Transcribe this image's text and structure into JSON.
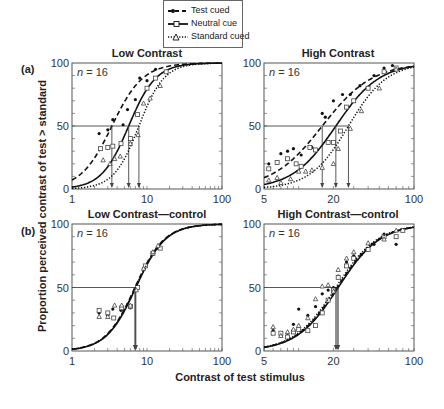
{
  "legend": {
    "items": [
      {
        "label": "Test cued",
        "style": "dashed",
        "marker": "filled-circle"
      },
      {
        "label": "Neutral cue",
        "style": "solid",
        "marker": "open-square"
      },
      {
        "label": "Standard cued",
        "style": "dotted",
        "marker": "open-triangle"
      }
    ]
  },
  "axis_labels": {
    "y": "Proportion perceived contrast of test > standard",
    "x": "Contrast of test stimulus"
  },
  "row_labels": {
    "a": "(a)",
    "b": "(b)"
  },
  "chart_data": [
    {
      "type": "line",
      "panel": "(a)",
      "title": "Low Contrast",
      "annotation": "n = 16",
      "xscale": "log",
      "xlim": [
        1,
        100
      ],
      "xticks": [
        "1",
        "10",
        "100"
      ],
      "ylim": [
        0,
        100
      ],
      "yticks": [
        "0",
        "50",
        "100"
      ],
      "reference_line_y": 50,
      "series": [
        {
          "name": "Test cued",
          "pse": 3.4,
          "slope": 2.1,
          "points": [
            [
              2.3,
              44
            ],
            [
              3,
              47
            ],
            [
              3.5,
              55
            ],
            [
              4.8,
              51
            ],
            [
              5.5,
              63
            ],
            [
              7,
              71
            ],
            [
              8,
              88
            ],
            [
              10,
              86
            ],
            [
              13,
              95
            ]
          ]
        },
        {
          "name": "Neutral cue",
          "pse": 5.7,
          "slope": 2.4,
          "points": [
            [
              2.4,
              32
            ],
            [
              3,
              33
            ],
            [
              3.5,
              34
            ],
            [
              4.5,
              36
            ],
            [
              6,
              40
            ],
            [
              7.5,
              59
            ],
            [
              10,
              80
            ],
            [
              13,
              88
            ],
            [
              18,
              93
            ]
          ]
        },
        {
          "name": "Standard cued",
          "pse": 7.8,
          "slope": 2.6,
          "points": [
            [
              2.6,
              23
            ],
            [
              3.2,
              20
            ],
            [
              3.7,
              24
            ],
            [
              4.4,
              26
            ],
            [
              6,
              36
            ],
            [
              7.6,
              43
            ],
            [
              9,
              68
            ],
            [
              11,
              72
            ],
            [
              15,
              82
            ]
          ]
        }
      ]
    },
    {
      "type": "line",
      "panel": "(a)",
      "title": "High Contrast",
      "annotation": "n = 16",
      "xscale": "log",
      "xlim": [
        5,
        100
      ],
      "xticks": [
        "5",
        "20",
        "100"
      ],
      "ylim": [
        0,
        100
      ],
      "yticks": [
        "0",
        "50",
        "100"
      ],
      "reference_line_y": 50,
      "series": [
        {
          "name": "Test cued",
          "pse": 16,
          "slope": 2.0,
          "points": [
            [
              5.5,
              20
            ],
            [
              7,
              28
            ],
            [
              8,
              30
            ],
            [
              9,
              32
            ],
            [
              10.5,
              27
            ],
            [
              13,
              33
            ],
            [
              16,
              60
            ],
            [
              17,
              57
            ],
            [
              20,
              70
            ],
            [
              24,
              75
            ],
            [
              28,
              75
            ],
            [
              34,
              82
            ],
            [
              45,
              90
            ],
            [
              55,
              96
            ],
            [
              65,
              98
            ]
          ]
        },
        {
          "name": "Neutral cue",
          "pse": 21,
          "slope": 2.3,
          "points": [
            [
              5.5,
              16
            ],
            [
              6.5,
              21
            ],
            [
              8,
              24
            ],
            [
              9.5,
              20
            ],
            [
              10.5,
              18
            ],
            [
              12.5,
              33
            ],
            [
              14,
              31
            ],
            [
              18,
              37
            ],
            [
              20,
              37
            ],
            [
              23,
              46
            ],
            [
              26,
              65
            ],
            [
              30,
              70
            ],
            [
              40,
              80
            ],
            [
              55,
              93
            ],
            [
              70,
              96
            ]
          ]
        },
        {
          "name": "Standard cued",
          "pse": 27,
          "slope": 2.6,
          "points": [
            [
              5.5,
              7
            ],
            [
              6.5,
              9
            ],
            [
              7,
              5
            ],
            [
              8.5,
              8
            ],
            [
              10,
              14
            ],
            [
              11.5,
              14
            ],
            [
              13,
              15
            ],
            [
              16,
              17
            ],
            [
              20,
              20
            ],
            [
              22,
              32
            ],
            [
              28,
              48
            ],
            [
              35,
              62
            ],
            [
              50,
              80
            ],
            [
              70,
              95
            ]
          ]
        }
      ]
    },
    {
      "type": "line",
      "panel": "(b)",
      "title": "Low Contrast—control",
      "annotation": "n = 16",
      "xscale": "log",
      "xlim": [
        1,
        100
      ],
      "xticks": [
        "1",
        "10",
        "100"
      ],
      "ylim": [
        0,
        100
      ],
      "yticks": [
        "0",
        "50",
        "100"
      ],
      "reference_line_y": 50,
      "series": [
        {
          "name": "Test cued",
          "pse": 6.9,
          "slope": 2.2,
          "points": [
            [
              2.3,
              30
            ],
            [
              3,
              28
            ],
            [
              3.5,
              33
            ],
            [
              4.5,
              32
            ],
            [
              6,
              34
            ],
            [
              7,
              48
            ],
            [
              9,
              65
            ],
            [
              12,
              76
            ],
            [
              14,
              81
            ]
          ]
        },
        {
          "name": "Neutral cue",
          "pse": 7.1,
          "slope": 2.2,
          "points": [
            [
              2.3,
              32
            ],
            [
              3,
              30
            ],
            [
              3.6,
              26
            ],
            [
              4.6,
              34
            ],
            [
              6,
              35
            ],
            [
              7.5,
              50
            ],
            [
              9.5,
              67
            ],
            [
              12,
              77
            ],
            [
              15,
              81
            ]
          ]
        },
        {
          "name": "Standard cued",
          "pse": 7.0,
          "slope": 2.2,
          "points": [
            [
              2.3,
              27
            ],
            [
              3,
              27
            ],
            [
              3.7,
              36
            ],
            [
              4.6,
              36
            ],
            [
              6,
              36
            ],
            [
              7.2,
              48
            ],
            [
              9,
              65
            ],
            [
              12,
              78
            ],
            [
              14,
              83
            ]
          ]
        }
      ]
    },
    {
      "type": "line",
      "panel": "(b)",
      "title": "High Contrast—control",
      "annotation": "n = 16",
      "xscale": "log",
      "xlim": [
        5,
        100
      ],
      "xticks": [
        "5",
        "20",
        "100"
      ],
      "ylim": [
        0,
        100
      ],
      "yticks": [
        "0",
        "50",
        "100"
      ],
      "reference_line_y": 50,
      "series": [
        {
          "name": "Test cued",
          "pse": 21.5,
          "slope": 2.4,
          "points": [
            [
              6,
              16
            ],
            [
              7,
              12
            ],
            [
              8,
              14
            ],
            [
              9,
              21
            ],
            [
              10,
              33
            ],
            [
              12,
              28
            ],
            [
              14,
              35
            ],
            [
              16,
              45
            ],
            [
              18,
              48
            ],
            [
              20,
              50
            ],
            [
              22,
              59
            ],
            [
              26,
              70
            ],
            [
              30,
              75
            ],
            [
              35,
              76
            ],
            [
              45,
              84
            ],
            [
              55,
              92
            ],
            [
              70,
              84
            ]
          ]
        },
        {
          "name": "Neutral cue",
          "pse": 22,
          "slope": 2.4,
          "points": [
            [
              6,
              14
            ],
            [
              7,
              14
            ],
            [
              8,
              11
            ],
            [
              9,
              15
            ],
            [
              10,
              17
            ],
            [
              12,
              16
            ],
            [
              14,
              20
            ],
            [
              16,
              30
            ],
            [
              18,
              40
            ],
            [
              20,
              48
            ],
            [
              22,
              58
            ],
            [
              26,
              67
            ],
            [
              30,
              73
            ],
            [
              40,
              80
            ],
            [
              55,
              90
            ],
            [
              70,
              90
            ],
            [
              80,
              95
            ]
          ]
        },
        {
          "name": "Standard cued",
          "pse": 21,
          "slope": 2.4,
          "points": [
            [
              6,
              19
            ],
            [
              7,
              12
            ],
            [
              8,
              15
            ],
            [
              9,
              17
            ],
            [
              10,
              20
            ],
            [
              12,
              26
            ],
            [
              14,
              41
            ],
            [
              16,
              51
            ],
            [
              18,
              52
            ],
            [
              20,
              47
            ],
            [
              22,
              64
            ],
            [
              26,
              73
            ],
            [
              30,
              78
            ],
            [
              40,
              85
            ],
            [
              55,
              88
            ],
            [
              70,
              95
            ]
          ]
        }
      ]
    }
  ]
}
